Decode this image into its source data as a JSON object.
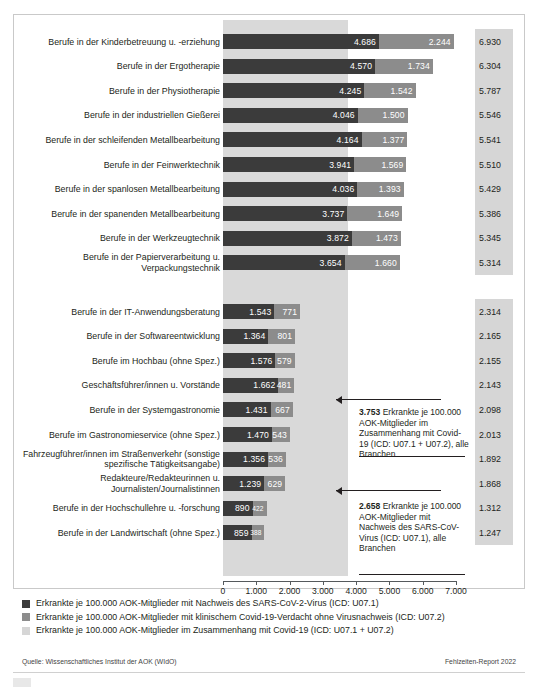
{
  "chart_data": {
    "type": "bar",
    "orientation": "horizontal",
    "stacked": true,
    "title": "",
    "xlabel": "",
    "ylabel": "",
    "xlim": [
      0,
      7000
    ],
    "xticks": [
      "0",
      "1.000",
      "2.000",
      "3.000",
      "4.000",
      "5.000",
      "6.000",
      "7.000"
    ],
    "grid": false,
    "legend_position": "bottom",
    "series": [
      {
        "name": "Erkrankte je 100.000 AOK-Mitglieder mit Nachweis des SARS-CoV-2-Virus (ICD: U07.1)",
        "color": "#3b3b3b"
      },
      {
        "name": "Erkrankte je 100.000 AOK-Mitglieder mit klinischem Covid-19-Verdacht ohne Virusnachweis (ICD: U07.2)",
        "color": "#8c8c8c"
      },
      {
        "name": "Erkrankte je 100.000 AOK-Mitglieder im Zusammenhang mit Covid-19 (ICD: U07.1 + U07.2)",
        "color": "#d6d6d6"
      }
    ],
    "groups": [
      {
        "rows": [
          {
            "category": "Berufe in der Kinderbetreuung u. -erziehung",
            "u071": 4686,
            "u072": 2244,
            "total": 6930,
            "u071_label": "4.686",
            "u072_label": "2.244",
            "total_label": "6.930"
          },
          {
            "category": "Berufe in der Ergotherapie",
            "u071": 4570,
            "u072": 1734,
            "total": 6304,
            "u071_label": "4.570",
            "u072_label": "1.734",
            "total_label": "6.304"
          },
          {
            "category": "Berufe in der Physiotherapie",
            "u071": 4245,
            "u072": 1542,
            "total": 5787,
            "u071_label": "4.245",
            "u072_label": "1.542",
            "total_label": "5.787"
          },
          {
            "category": "Berufe in der industriellen Gießerei",
            "u071": 4046,
            "u072": 1500,
            "total": 5546,
            "u071_label": "4.046",
            "u072_label": "1.500",
            "total_label": "5.546"
          },
          {
            "category": "Berufe in der schleifenden Metallbearbeitung",
            "u071": 4164,
            "u072": 1377,
            "total": 5541,
            "u071_label": "4.164",
            "u072_label": "1.377",
            "total_label": "5.541"
          },
          {
            "category": "Berufe in der Feinwerktechnik",
            "u071": 3941,
            "u072": 1569,
            "total": 5510,
            "u071_label": "3.941",
            "u072_label": "1.569",
            "total_label": "5.510"
          },
          {
            "category": "Berufe in der spanlosen Metallbearbeitung",
            "u071": 4036,
            "u072": 1393,
            "total": 5429,
            "u071_label": "4.036",
            "u072_label": "1.393",
            "total_label": "5.429"
          },
          {
            "category": "Berufe in der spanenden Metallbearbeitung",
            "u071": 3737,
            "u072": 1649,
            "total": 5386,
            "u071_label": "3.737",
            "u072_label": "1.649",
            "total_label": "5.386"
          },
          {
            "category": "Berufe in der Werkzeugtechnik",
            "u071": 3872,
            "u072": 1473,
            "total": 5345,
            "u071_label": "3.872",
            "u072_label": "1.473",
            "total_label": "5.345"
          },
          {
            "category": "Berufe in der Papierverarbeitung u. Verpackungstechnik",
            "u071": 3654,
            "u072": 1660,
            "total": 5314,
            "u071_label": "3.654",
            "u072_label": "1.660",
            "total_label": "5.314"
          }
        ]
      },
      {
        "rows": [
          {
            "category": "Berufe in der IT-Anwendungsberatung",
            "u071": 1543,
            "u072": 771,
            "total": 2314,
            "u071_label": "1.543",
            "u072_label": "771",
            "total_label": "2.314"
          },
          {
            "category": "Berufe in der Softwareentwicklung",
            "u071": 1364,
            "u072": 801,
            "total": 2165,
            "u071_label": "1.364",
            "u072_label": "801",
            "total_label": "2.165"
          },
          {
            "category": "Berufe im Hochbau (ohne Spez.)",
            "u071": 1576,
            "u072": 579,
            "total": 2155,
            "u071_label": "1.576",
            "u072_label": "579",
            "total_label": "2.155"
          },
          {
            "category": "Geschäftsführer/innen u. Vorstände",
            "u071": 1662,
            "u072": 481,
            "total": 2143,
            "u071_label": "1.662",
            "u072_label": "481",
            "total_label": "2.143"
          },
          {
            "category": "Berufe in der Systemgastronomie",
            "u071": 1431,
            "u072": 667,
            "total": 2098,
            "u071_label": "1.431",
            "u072_label": "667",
            "total_label": "2.098"
          },
          {
            "category": "Berufe im Gastronomieservice (ohne Spez.)",
            "u071": 1470,
            "u072": 543,
            "total": 2013,
            "u071_label": "1.470",
            "u072_label": "543",
            "total_label": "2.013"
          },
          {
            "category": "Fahrzeugführer/innen im Straßenverkehr (sonstige spezifische Tätigkeitsangabe)",
            "u071": 1356,
            "u072": 536,
            "total": 1892,
            "u071_label": "1.356",
            "u072_label": "536",
            "total_label": "1.892"
          },
          {
            "category": "Redakteure/Redakteurinnen u. Journalisten/Journalistinnen",
            "u071": 1239,
            "u072": 629,
            "total": 1868,
            "u071_label": "1.239",
            "u072_label": "629",
            "total_label": "1.868"
          },
          {
            "category": "Berufe in der Hochschullehre u. -forschung",
            "u071": 890,
            "u072": 422,
            "total": 1312,
            "u071_label": "890",
            "u072_label": "422",
            "total_label": "1.312"
          },
          {
            "category": "Berufe in der Landwirtschaft (ohne Spez.)",
            "u071": 859,
            "u072": 388,
            "total": 1247,
            "u071_label": "859",
            "u072_label": "388",
            "total_label": "1.247"
          }
        ]
      }
    ],
    "reference_bands": [
      {
        "value": 2658,
        "color": "#b2b2b2",
        "name": "alle Branchen U07.1"
      },
      {
        "value": 3753,
        "color": "#d9d9d9",
        "name": "alle Branchen U07.1 + U07.2"
      }
    ],
    "annotations": [
      {
        "value_label": "3.753",
        "text": " Erkrankte je 100.000 AOK-Mitglieder im Zusammenhang mit Covid-19 (ICD: U07.1 + U07.2), alle Branchen"
      },
      {
        "value_label": "2.658",
        "text": " Erkrankte je 100.000 AOK-Mitglieder mit Nachweis des SARS-CoV-Virus (ICD: U07.1), alle Branchen"
      }
    ]
  },
  "footer": {
    "source": "Quelle: Wissenschaftliches Institut der AOK (WIdO)",
    "report": "Fehlzeiten-Report 2022"
  }
}
